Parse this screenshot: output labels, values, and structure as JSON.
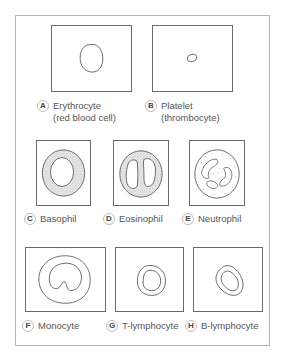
{
  "cells": [
    {
      "letter": "A",
      "name": "Erythrocyte",
      "subname": "(red blood cell)"
    },
    {
      "letter": "B",
      "name": "Platelet",
      "subname": "(thrombocyte)"
    },
    {
      "letter": "C",
      "name": "Basophil",
      "subname": ""
    },
    {
      "letter": "D",
      "name": "Eosinophil",
      "subname": ""
    },
    {
      "letter": "E",
      "name": "Neutrophil",
      "subname": ""
    },
    {
      "letter": "F",
      "name": "Monocyte",
      "subname": ""
    },
    {
      "letter": "G",
      "name": "T-lymphocyte",
      "subname": ""
    },
    {
      "letter": "H",
      "name": "B-lymphocyte",
      "subname": ""
    }
  ],
  "colors": {
    "outline": "#5a5a5a",
    "frame": "#b5b5b5",
    "granule_fill": "#e9e9e9"
  }
}
